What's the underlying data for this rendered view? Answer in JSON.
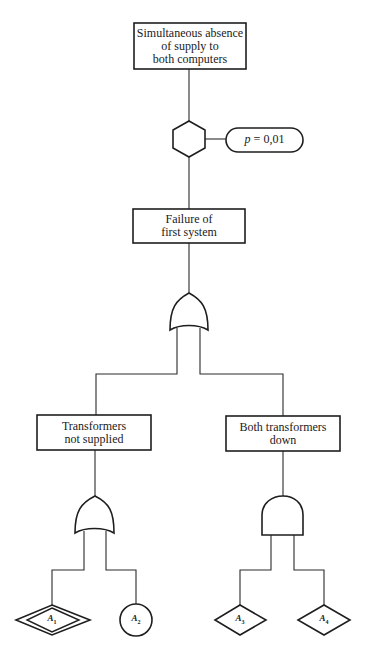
{
  "diagram": {
    "type": "fault-tree",
    "top_event": {
      "lines": [
        "Simultaneous absence",
        "of supply to",
        "both computers"
      ]
    },
    "inhibit_gate": {
      "shape": "hexagon",
      "condition_var": "p",
      "condition_eq": "= 0,01"
    },
    "intermediate_event": {
      "lines": [
        "Failure of",
        "first system"
      ]
    },
    "main_gate": {
      "type": "OR"
    },
    "left_event": {
      "lines": [
        "Transformers",
        "not supplied"
      ],
      "gate": {
        "type": "OR"
      }
    },
    "right_event": {
      "lines": [
        "Both transformers",
        "down"
      ],
      "gate": {
        "type": "AND"
      }
    },
    "basic_events": [
      {
        "symbol": "A",
        "index": "1",
        "shape": "double-diamond"
      },
      {
        "symbol": "A",
        "index": "2",
        "shape": "circle"
      },
      {
        "symbol": "A",
        "index": "3",
        "shape": "diamond"
      },
      {
        "symbol": "A",
        "index": "4",
        "shape": "diamond"
      }
    ]
  }
}
